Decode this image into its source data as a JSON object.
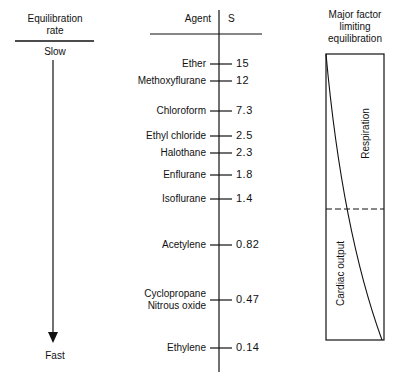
{
  "left": {
    "title_line1": "Equilibration",
    "title_line2": "rate",
    "slow_label": "Slow",
    "fast_label": "Fast"
  },
  "middle": {
    "agent_header": "Agent",
    "s_header": "S",
    "rows": [
      {
        "agent": "Ether",
        "s": "15",
        "y": 64
      },
      {
        "agent": "Methoxyflurane",
        "s": "12",
        "y": 81
      },
      {
        "agent": "Chloroform",
        "s": "7.3",
        "y": 111
      },
      {
        "agent": "Ethyl chloride",
        "s": "2.5",
        "y": 136
      },
      {
        "agent": "Halothane",
        "s": "2.3",
        "y": 153
      },
      {
        "agent": "Enflurane",
        "s": "1.8",
        "y": 175
      },
      {
        "agent": "Isoflurane",
        "s": "1.4",
        "y": 199
      },
      {
        "agent": "Acetylene",
        "s": "0.82",
        "y": 245
      },
      {
        "agent": "Cyclopropane",
        "agent2": "Nitrous oxide",
        "s": "0.47",
        "y": 300
      },
      {
        "agent": "Ethylene",
        "s": "0.14",
        "y": 348
      }
    ]
  },
  "right": {
    "title_line1": "Major factor",
    "title_line2": "limiting",
    "title_line3": "equilibration",
    "upper_label": "Respiration",
    "lower_label": "Cardiac output"
  }
}
